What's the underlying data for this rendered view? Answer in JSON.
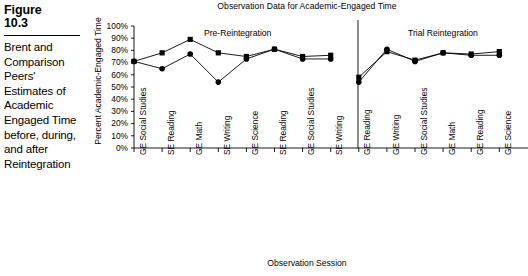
{
  "figure": {
    "number_label": "Figure\n10.3",
    "number_line1": "Figure",
    "number_line2": "10.3",
    "caption": "Brent and Comparison Peers' Estimates of Academic Engaged Time before, during, and after Reintegration"
  },
  "chart_data": {
    "type": "line",
    "title": "Observation Data for Academic-Engaged Time",
    "xlabel": "Observation Session",
    "ylabel": "Percent Academic-Engaged Time",
    "ylim": [
      0,
      100
    ],
    "ytick_labels": [
      "100%",
      "90%",
      "80%",
      "70%",
      "60%",
      "50%",
      "40%",
      "30%",
      "20%",
      "10%",
      "0%"
    ],
    "ytick_values": [
      100,
      90,
      80,
      70,
      60,
      50,
      40,
      30,
      20,
      10,
      0
    ],
    "grid": false,
    "legend": "none",
    "panels": [
      {
        "label": "Pre-Reintegration",
        "start_index": 0,
        "end_index": 7
      },
      {
        "label": "Trial Reintegration",
        "start_index": 8,
        "end_index": 13
      }
    ],
    "categories": [
      "GE Social Studies",
      "SE Reading",
      "GE Math",
      "SE Writing",
      "GE Science",
      "SE Reading",
      "GE Social Studies",
      "SE Writing",
      "GE Reading",
      "GE Writing",
      "GE Social Studies",
      "GE Math",
      "GE Reading",
      "GE Science"
    ],
    "series": [
      {
        "name": "Brent",
        "marker": "square",
        "values": [
          71,
          78,
          89,
          78,
          75,
          81,
          75,
          76,
          58,
          79,
          72,
          78,
          77,
          79
        ]
      },
      {
        "name": "Comparison Peers",
        "marker": "circle",
        "values": [
          71,
          65,
          77,
          54,
          73,
          81,
          73,
          73,
          54,
          81,
          71,
          78,
          76,
          76
        ]
      }
    ]
  }
}
